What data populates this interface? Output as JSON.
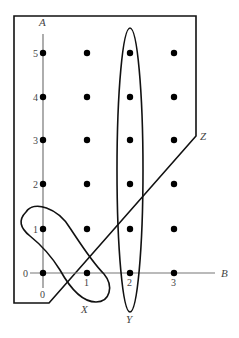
{
  "axes": {
    "vertical_label": "A",
    "horizontal_label": "B",
    "x_ticks": [
      "0",
      "1",
      "2",
      "3"
    ],
    "y_ticks": [
      "0",
      "1",
      "2",
      "3",
      "4",
      "5"
    ]
  },
  "sets": {
    "X": {
      "label": "X"
    },
    "Y": {
      "label": "Y"
    },
    "Z": {
      "label": "Z"
    }
  },
  "grid_points": {
    "columns": [
      0,
      1,
      2,
      3
    ],
    "rows": [
      0,
      1,
      2,
      3,
      4,
      5
    ]
  },
  "colors": {
    "stroke": "#111111",
    "axis": "#777777",
    "point": "#000000"
  }
}
